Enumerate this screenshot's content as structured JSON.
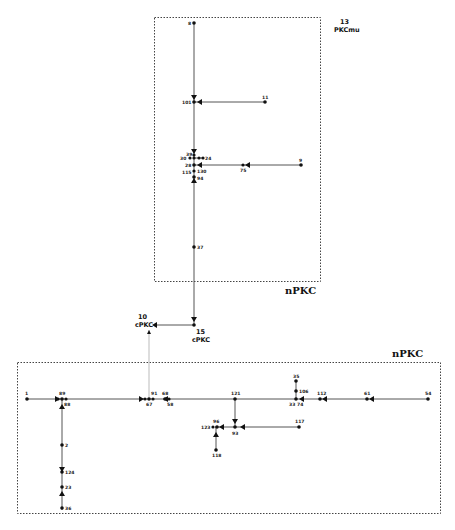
{
  "groups": [
    {
      "id": "top",
      "label": "nPKC"
    },
    {
      "id": "bottom",
      "label": "nPKC"
    }
  ],
  "special_nodes": {
    "pkcmu": {
      "number": "13",
      "name": "PKCmu"
    },
    "cpkc15": {
      "number": "15",
      "name": "cPKC"
    },
    "cpkc10": {
      "number": "10",
      "name": "cPKC"
    }
  },
  "top_nodes": [
    "8",
    "101",
    "11",
    "39",
    "30",
    "24",
    "28",
    "130",
    "115",
    "94",
    "75",
    "9",
    "37"
  ],
  "bottom_nodes": [
    "1",
    "89",
    "88",
    "91",
    "67",
    "68",
    "58",
    "121",
    "35",
    "106",
    "33",
    "74",
    "112",
    "61",
    "54",
    "96",
    "123",
    "93",
    "117",
    "118",
    "2",
    "124",
    "23",
    "36"
  ]
}
